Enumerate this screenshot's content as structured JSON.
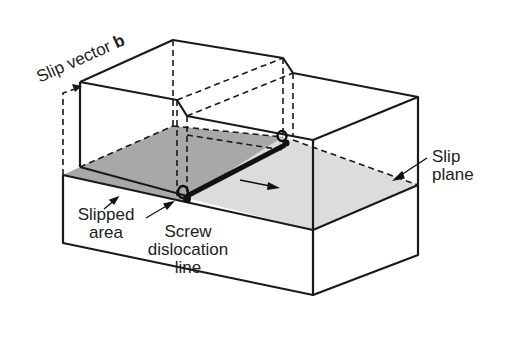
{
  "diagram": {
    "labels": {
      "slip_vector_prefix": "Slip vector ",
      "slip_vector_symbol": "b",
      "slip_plane_line1": "Slip",
      "slip_plane_line2": "plane",
      "slipped_area_line1": "Slipped",
      "slipped_area_line2": "area",
      "screw_line1": "Screw",
      "screw_line2": "dislocation",
      "screw_line3": "line"
    },
    "colors": {
      "line": "#1a1a1a",
      "slipped_area_fill": "#a8a8a8",
      "slip_plane_fill": "#dcdcdc",
      "background": "#ffffff"
    }
  }
}
